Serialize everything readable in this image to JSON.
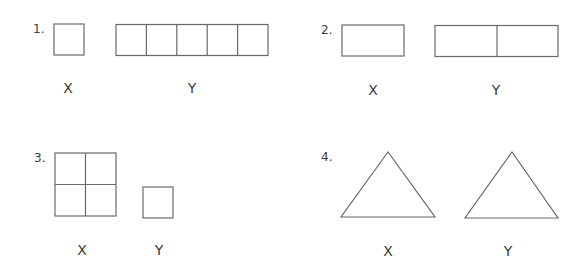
{
  "colors": {
    "stroke": "#6a6a6a",
    "text": "#3a3a3a",
    "background": "#ffffff"
  },
  "problems": [
    {
      "number": "1.",
      "x_label": "X",
      "y_label": "Y",
      "x_shape": "1 square",
      "y_shape": "row of 5 squares"
    },
    {
      "number": "2.",
      "x_label": "X",
      "y_label": "Y",
      "x_shape": "1 rectangle",
      "y_shape": "row of 2 rectangles"
    },
    {
      "number": "3.",
      "x_label": "X",
      "y_label": "Y",
      "x_shape": "2x2 grid of squares",
      "y_shape": "1 square"
    },
    {
      "number": "4.",
      "x_label": "X",
      "y_label": "Y",
      "x_shape": "triangle",
      "y_shape": "triangle"
    }
  ]
}
